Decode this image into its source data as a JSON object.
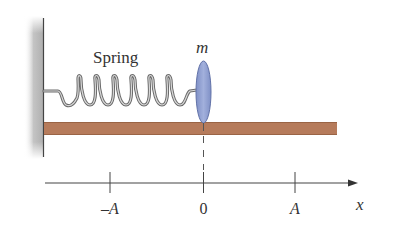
{
  "diagram": {
    "labels": {
      "spring": "Spring",
      "mass": "m",
      "neg_amp": "–A",
      "origin": "0",
      "pos_amp": "A",
      "axis": "x"
    },
    "colors": {
      "mass_fill": "#8f9fd0",
      "mass_stroke": "#5a6aa0",
      "plank": "#b57a5a",
      "plank_edge": "#8e5a3e",
      "spring": "#8a8a8a",
      "wall_shadow": "#bdbdbd",
      "line": "#333333"
    },
    "axis_ticks": [
      {
        "label": "–A",
        "x": 110
      },
      {
        "label": "0",
        "x": 203
      },
      {
        "label": "A",
        "x": 295
      }
    ]
  }
}
